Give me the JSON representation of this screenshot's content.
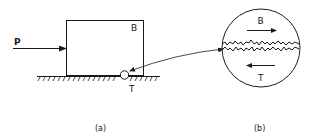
{
  "figure": {
    "panel_a": {
      "force_label": "P",
      "block_label": "B",
      "contact_label": "T",
      "caption": "(a)"
    },
    "panel_b": {
      "upper_label": "B",
      "lower_label": "T",
      "caption": "(b)"
    },
    "colors": {
      "ink": "#1a1a1a",
      "background": "#ffffff"
    }
  }
}
